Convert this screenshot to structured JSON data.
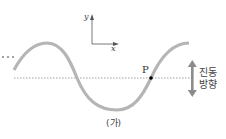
{
  "diagram": {
    "axes": {
      "y_label": "y",
      "x_label": "x"
    },
    "point_label": "P",
    "direction_label_line1": "진동",
    "direction_label_line2": "방향",
    "caption": "(가)",
    "ellipsis": "···",
    "colors": {
      "wave": "#b5b5b5",
      "axes": "#555555",
      "dashed_line": "#8a8a8a",
      "point": "#000000",
      "arrow": "#8c8c8c"
    }
  }
}
